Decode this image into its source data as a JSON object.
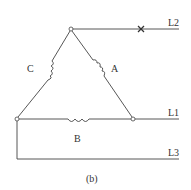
{
  "diagram": {
    "caption": "(b)",
    "type": "delta-connected three-phase winding",
    "windings": [
      {
        "id": "A",
        "label": "A",
        "between": [
          "top",
          "bottom-right"
        ]
      },
      {
        "id": "B",
        "label": "B",
        "between": [
          "bottom-left",
          "bottom-right"
        ]
      },
      {
        "id": "C",
        "label": "C",
        "between": [
          "top",
          "bottom-left"
        ]
      }
    ],
    "lines": [
      {
        "id": "L2",
        "label": "L2",
        "from": "top",
        "broken": true,
        "break_mark": "×"
      },
      {
        "id": "L1",
        "label": "L1",
        "from": "bottom-right",
        "broken": false
      },
      {
        "id": "L3",
        "label": "L3",
        "from": "bottom-left",
        "broken": false
      }
    ],
    "colors": {
      "stroke": "#444444",
      "text": "#333333",
      "background": "#ffffff"
    }
  }
}
